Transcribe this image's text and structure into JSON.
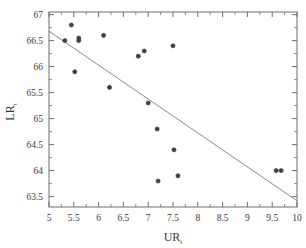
{
  "chart_data": {
    "type": "scatter",
    "title": "",
    "xlabel": "UR",
    "xlabel_sub": "t",
    "ylabel": "LR",
    "ylabel_sub": "t",
    "xlim": [
      5,
      10
    ],
    "ylim": [
      63.3,
      67.05
    ],
    "xticks": [
      5,
      5.5,
      6,
      6.5,
      7,
      7.5,
      8,
      8.5,
      9,
      9.5,
      10
    ],
    "xtick_labels": [
      "5",
      "5.5",
      "6",
      "6.5",
      "7",
      "7.5",
      "8",
      "8.5",
      "9",
      "9.5",
      "10"
    ],
    "yticks": [
      63.5,
      64,
      64.5,
      65,
      65.5,
      66,
      66.5,
      67
    ],
    "ytick_labels": [
      "63.5",
      "64",
      "64.5",
      "65",
      "65.5",
      "66",
      "66.5",
      "67"
    ],
    "grid": false,
    "legend": null,
    "marker_color": "#3f3f3f",
    "line_color": "#8a8a8a",
    "frame_color": "#6e6e6e",
    "points": [
      {
        "x": 5.32,
        "y": 66.5
      },
      {
        "x": 5.45,
        "y": 66.8
      },
      {
        "x": 5.52,
        "y": 65.9
      },
      {
        "x": 5.6,
        "y": 66.55
      },
      {
        "x": 5.6,
        "y": 66.5
      },
      {
        "x": 6.1,
        "y": 66.6
      },
      {
        "x": 6.22,
        "y": 65.6
      },
      {
        "x": 6.8,
        "y": 66.2
      },
      {
        "x": 6.92,
        "y": 66.3
      },
      {
        "x": 7.0,
        "y": 65.3
      },
      {
        "x": 7.18,
        "y": 64.8
      },
      {
        "x": 7.2,
        "y": 63.8
      },
      {
        "x": 7.5,
        "y": 66.4
      },
      {
        "x": 7.52,
        "y": 64.4
      },
      {
        "x": 7.6,
        "y": 63.9
      },
      {
        "x": 9.58,
        "y": 64.0
      },
      {
        "x": 9.68,
        "y": 64.0
      }
    ],
    "fit_line": {
      "name": "regression-line",
      "x0": 5.0,
      "y0": 66.68,
      "x1": 10.0,
      "y1": 63.42
    }
  }
}
